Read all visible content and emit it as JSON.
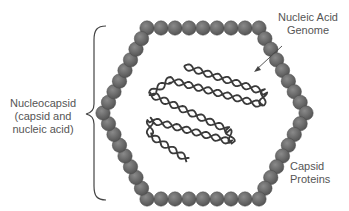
{
  "diagram": {
    "labels": {
      "nucleocapsid": [
        "Nucleocapsid",
        "(capsid and",
        "nucleic acid)"
      ],
      "genome": [
        "Nucleic Acid",
        "Genome"
      ],
      "capsid": [
        "Capsid",
        "Proteins"
      ]
    },
    "colors": {
      "bead": "#606060",
      "bead_highlight": "#8a8a8a",
      "strand": "#3a3a3a",
      "text": "#555555",
      "line": "#444444"
    }
  }
}
